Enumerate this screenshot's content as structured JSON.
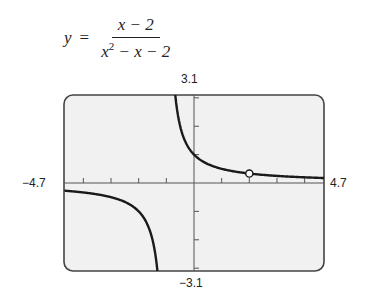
{
  "equation": {
    "lhs": "y",
    "equals": "=",
    "numerator": "x − 2",
    "denominator_base": "x",
    "denominator_exp": "2",
    "denominator_rest": " − x − 2"
  },
  "window": {
    "xmin_label": "−4.7",
    "xmax_label": "4.7",
    "ymin_label": "−3.1",
    "ymax_label": "3.1"
  },
  "colors": {
    "frame": "#444444",
    "screen_bg": "#f1f1f1",
    "curve": "#1a1a1a",
    "axis": "#555555"
  },
  "chart_data": {
    "type": "line",
    "function": "(x-2)/(x^2-x-2)",
    "simplified": "1/(x+1), x ≠ 2",
    "xlim": [
      -4.7,
      4.7
    ],
    "ylim": [
      -3.1,
      3.1
    ],
    "x_ticks": [
      -4,
      -3,
      -2,
      -1,
      1,
      2,
      3,
      4
    ],
    "y_ticks": [
      -3,
      -2,
      -1,
      1,
      2,
      3
    ],
    "grid": false,
    "vertical_asymptote": -1,
    "horizontal_asymptote": 0,
    "hole": {
      "x": 2,
      "y": 0.333
    },
    "series": [
      {
        "name": "left branch",
        "x": [
          -4.7,
          -4,
          -3,
          -2.5,
          -2,
          -1.75,
          -1.5,
          -1.4,
          -1.33
        ],
        "y": [
          -0.27,
          -0.333,
          -0.5,
          -0.667,
          -1.0,
          -1.333,
          -2.0,
          -2.5,
          -3.0
        ]
      },
      {
        "name": "right branch",
        "x": [
          -0.68,
          -0.6,
          -0.5,
          -0.25,
          0,
          0.5,
          1,
          2,
          3,
          4,
          4.7
        ],
        "y": [
          3.1,
          2.5,
          2.0,
          1.333,
          1.0,
          0.667,
          0.5,
          0.333,
          0.25,
          0.2,
          0.27
        ]
      }
    ],
    "xlabel": "",
    "ylabel": ""
  }
}
